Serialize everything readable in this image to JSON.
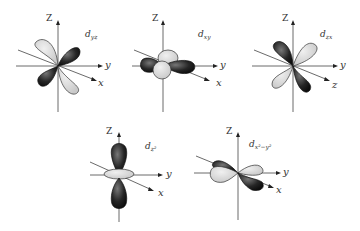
{
  "diagram": {
    "colors": {
      "dark_lobe": "#222222",
      "light_lobe": "#d9d9d9",
      "axis": "#444444"
    },
    "panels": [
      {
        "id": "dyz",
        "label": "d",
        "label_sub": "yz",
        "axes": {
          "z": "Z",
          "y": "y",
          "x": "x"
        }
      },
      {
        "id": "dxy",
        "label": "d",
        "label_sub": "xy",
        "axes": {
          "z": "Z",
          "y": "y",
          "x": "x"
        }
      },
      {
        "id": "dzx",
        "label": "d",
        "label_sub": "zx",
        "axes": {
          "z": "Z",
          "y": "y",
          "x": "z"
        }
      },
      {
        "id": "dz2",
        "label": "d",
        "label_sub": "z²",
        "axes": {
          "z": "Z",
          "y": "y",
          "x": "x"
        }
      },
      {
        "id": "dx2y2",
        "label": "d",
        "label_sub": "x²−y²",
        "axes": {
          "z": "Z",
          "y": "y",
          "x": "x"
        }
      }
    ]
  }
}
